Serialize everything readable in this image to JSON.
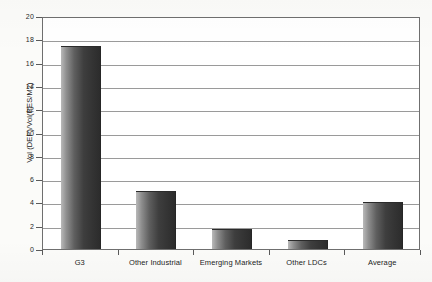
{
  "chart_data": {
    "type": "bar",
    "title": "",
    "subtitle": "",
    "xlabel": "",
    "ylabel": "Vol (DEP)/Vol(RES/M2)",
    "categories": [
      "G3",
      "Other Industrial",
      "Emerging Markets",
      "Other LDCs",
      "Average"
    ],
    "values": [
      17.4,
      4.95,
      1.7,
      0.75,
      4.05
    ],
    "series": [
      {
        "name": "Vol (DEP)/Vol(RES/M2)",
        "values": [
          17.4,
          4.95,
          1.7,
          0.75,
          4.05
        ]
      }
    ],
    "ylim": [
      0,
      20
    ],
    "ytick_labels": [
      "0",
      "2",
      "4",
      "6",
      "8",
      "10",
      "12",
      "14",
      "16",
      "18",
      "20"
    ],
    "ytick_values": [
      0,
      2,
      4,
      6,
      8,
      10,
      12,
      14,
      16,
      18,
      20
    ],
    "grid": true,
    "grid_axis": "y",
    "legend": false,
    "legend_position": "none",
    "bar_color": "#3e3e3e",
    "bar_color_light": "#b9b9b9",
    "grid_color": "#9a9a9a",
    "axis_color": "#5a5a5a",
    "plot_background": "#ffffff",
    "page_background": "#fbfbf9",
    "annotations": []
  }
}
